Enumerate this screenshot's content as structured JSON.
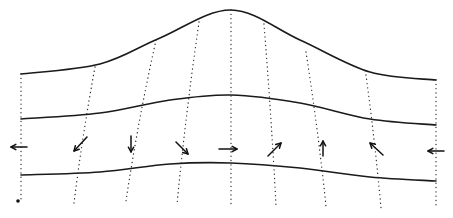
{
  "diagram": {
    "stroke_color": "#1a1a1a",
    "background": "#ffffff",
    "curves": [
      {
        "name": "top-surface",
        "points": [
          [
            21,
            74
          ],
          [
            100,
            64
          ],
          [
            160,
            38
          ],
          [
            231,
            10
          ],
          [
            300,
            40
          ],
          [
            370,
            72
          ],
          [
            436,
            80
          ]
        ]
      },
      {
        "name": "middle-line",
        "points": [
          [
            21,
            119
          ],
          [
            100,
            113
          ],
          [
            170,
            100
          ],
          [
            231,
            95
          ],
          [
            300,
            103
          ],
          [
            370,
            119
          ],
          [
            436,
            125
          ]
        ]
      },
      {
        "name": "bottom-line",
        "points": [
          [
            21,
            175
          ],
          [
            100,
            172
          ],
          [
            170,
            164
          ],
          [
            231,
            163
          ],
          [
            300,
            168
          ],
          [
            370,
            177
          ],
          [
            436,
            181
          ]
        ]
      }
    ],
    "dotted_lines": [
      {
        "top": [
          21,
          74
        ],
        "bottom": [
          21,
          202
        ]
      },
      {
        "top": [
          95,
          67
        ],
        "bottom": [
          74,
          203
        ]
      },
      {
        "top": [
          156,
          40
        ],
        "bottom": [
          126,
          201
        ]
      },
      {
        "top": [
          199,
          22
        ],
        "bottom": [
          177,
          204
        ]
      },
      {
        "top": [
          231,
          10
        ],
        "bottom": [
          231,
          205
        ]
      },
      {
        "top": [
          264,
          24
        ],
        "bottom": [
          276,
          205
        ]
      },
      {
        "top": [
          306,
          52
        ],
        "bottom": [
          326,
          206
        ]
      },
      {
        "top": [
          366,
          75
        ],
        "bottom": [
          381,
          208
        ]
      },
      {
        "top": [
          436,
          80
        ],
        "bottom": [
          436,
          208
        ]
      }
    ],
    "arrows": [
      {
        "direction": "left",
        "from": [
          27,
          147
        ],
        "to": [
          11,
          147
        ]
      },
      {
        "direction": "down-left",
        "from": [
          87,
          137
        ],
        "to": [
          74,
          151
        ]
      },
      {
        "direction": "down",
        "from": [
          131,
          136
        ],
        "to": [
          131,
          152
        ]
      },
      {
        "direction": "down-right",
        "from": [
          176,
          142
        ],
        "to": [
          188,
          154
        ]
      },
      {
        "direction": "right",
        "from": [
          219,
          149
        ],
        "to": [
          237,
          149
        ]
      },
      {
        "direction": "up-right",
        "from": [
          268,
          156
        ],
        "to": [
          281,
          143
        ]
      },
      {
        "direction": "up",
        "from": [
          323,
          156
        ],
        "to": [
          323,
          141
        ]
      },
      {
        "direction": "up-left",
        "from": [
          383,
          155
        ],
        "to": [
          370,
          143
        ]
      },
      {
        "direction": "left",
        "from": [
          444,
          151
        ],
        "to": [
          428,
          151
        ]
      }
    ],
    "marker_dot": [
      18,
      201
    ]
  }
}
